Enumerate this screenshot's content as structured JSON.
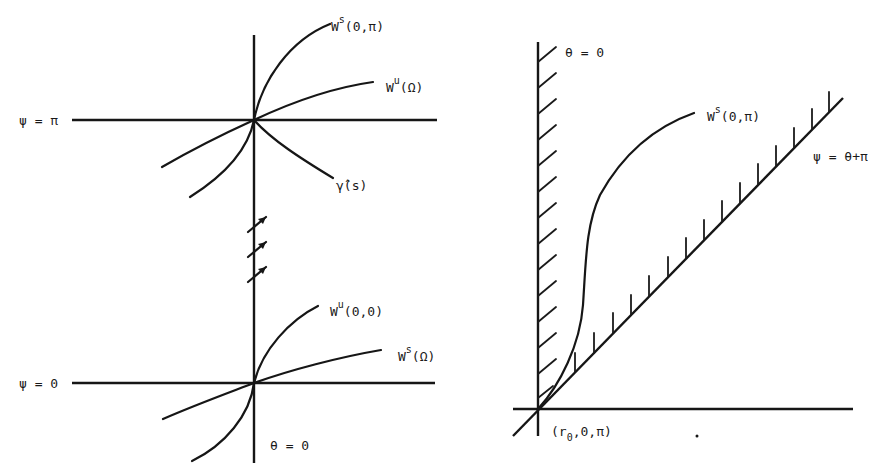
{
  "figure": {
    "left_panel": {
      "name": "phase-portrait-near-equilibria",
      "horizontal_lines": [
        {
          "label": "ψ = π",
          "y_px": 120
        },
        {
          "label": "ψ = 0",
          "y_px": 383
        }
      ],
      "vertical_axis_label": "θ = 0",
      "curve_labels": {
        "ws_0_pi": {
          "base": "W",
          "sup": "s",
          "args": "(0,π)"
        },
        "wu_omega": {
          "base": "W",
          "sup": "u",
          "args": "(Ω)"
        },
        "gamma_hat": {
          "text": "γ̂(s)"
        },
        "wu_0_0": {
          "base": "W",
          "sup": "u",
          "args": "(0,0)"
        },
        "ws_omega": {
          "base": "W",
          "sup": "s",
          "args": "(Ω)"
        }
      },
      "flow_arrows_count": 3
    },
    "right_panel": {
      "name": "wedge-region",
      "vertical_boundary_label": "θ = 0",
      "diagonal_boundary_label": "ψ = θ+π",
      "curve_label": {
        "base": "W",
        "sup": "s",
        "args": "(0,π)"
      },
      "origin_label": {
        "prefix": "(r",
        "sub": "0",
        "suffix": ",0,π)"
      },
      "vertical_hatch_count": 16,
      "diagonal_hatch_count": 14
    },
    "colors": {
      "ink": "#161616",
      "paper": "#ffffff",
      "bleed_through": "#ececec"
    }
  }
}
